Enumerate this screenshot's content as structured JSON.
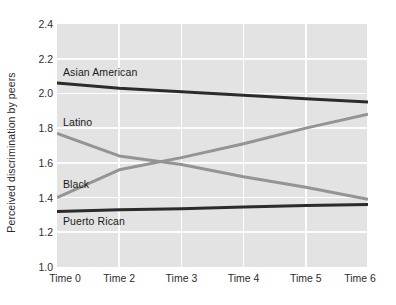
{
  "chart_data": {
    "type": "line",
    "title": "",
    "subtitle": "",
    "xlabel": "",
    "ylabel": "Perceived discrimination by peers",
    "x": [
      0,
      2,
      3,
      4,
      5,
      6
    ],
    "categories": [
      "Time 0",
      "Time 2",
      "Time 3",
      "Time 4",
      "Time 5",
      "Time 6"
    ],
    "xtick_labels": [
      "Time 0",
      "Time 2",
      "Time 3",
      "Time 4",
      "Time 5",
      "Time 6"
    ],
    "ytick_labels": [
      "2.4",
      "2.2",
      "2.0",
      "1.8",
      "1.6",
      "1.4",
      "1.2",
      "1.0"
    ],
    "ytick_values": [
      2.4,
      2.2,
      2.0,
      1.8,
      1.6,
      1.4,
      1.2,
      1.0
    ],
    "ylim": [
      1.0,
      2.4
    ],
    "xlim": [
      0,
      6
    ],
    "grid": true,
    "grid_color": "#fdfdfd",
    "plot_background": "#e3e3e3",
    "legend_position": "inline-labels",
    "series": [
      {
        "name": "Asian American",
        "label": "Asian American",
        "color": "#2b2b2b",
        "width": 3.0,
        "values": [
          2.06,
          2.03,
          2.01,
          1.99,
          1.97,
          1.95
        ],
        "start_value": 2.06,
        "end_value": 1.95,
        "label_x": 6,
        "label_y": 2.12
      },
      {
        "name": "Latino",
        "label": "Latino",
        "color": "#949494",
        "width": 3.0,
        "values": [
          1.77,
          1.64,
          1.59,
          1.52,
          1.46,
          1.39
        ],
        "start_value": 1.77,
        "end_value": 1.39,
        "label_x": 6,
        "label_y": 1.83
      },
      {
        "name": "Black",
        "label": "Black",
        "color": "#949494",
        "width": 3.0,
        "values": [
          1.4,
          1.56,
          1.63,
          1.71,
          1.8,
          1.88
        ],
        "start_value": 1.4,
        "end_value": 1.88,
        "label_x": 6,
        "label_y": 1.47
      },
      {
        "name": "Puerto Rican",
        "label": "Puerto Rican",
        "color": "#2b2b2b",
        "width": 3.0,
        "values": [
          1.32,
          1.33,
          1.335,
          1.345,
          1.355,
          1.36
        ],
        "start_value": 1.32,
        "end_value": 1.36,
        "label_x": 6,
        "label_y": 1.26
      }
    ],
    "annotations": [
      "Latino and Black series cross near Time 3 at approximately 1.60"
    ]
  }
}
